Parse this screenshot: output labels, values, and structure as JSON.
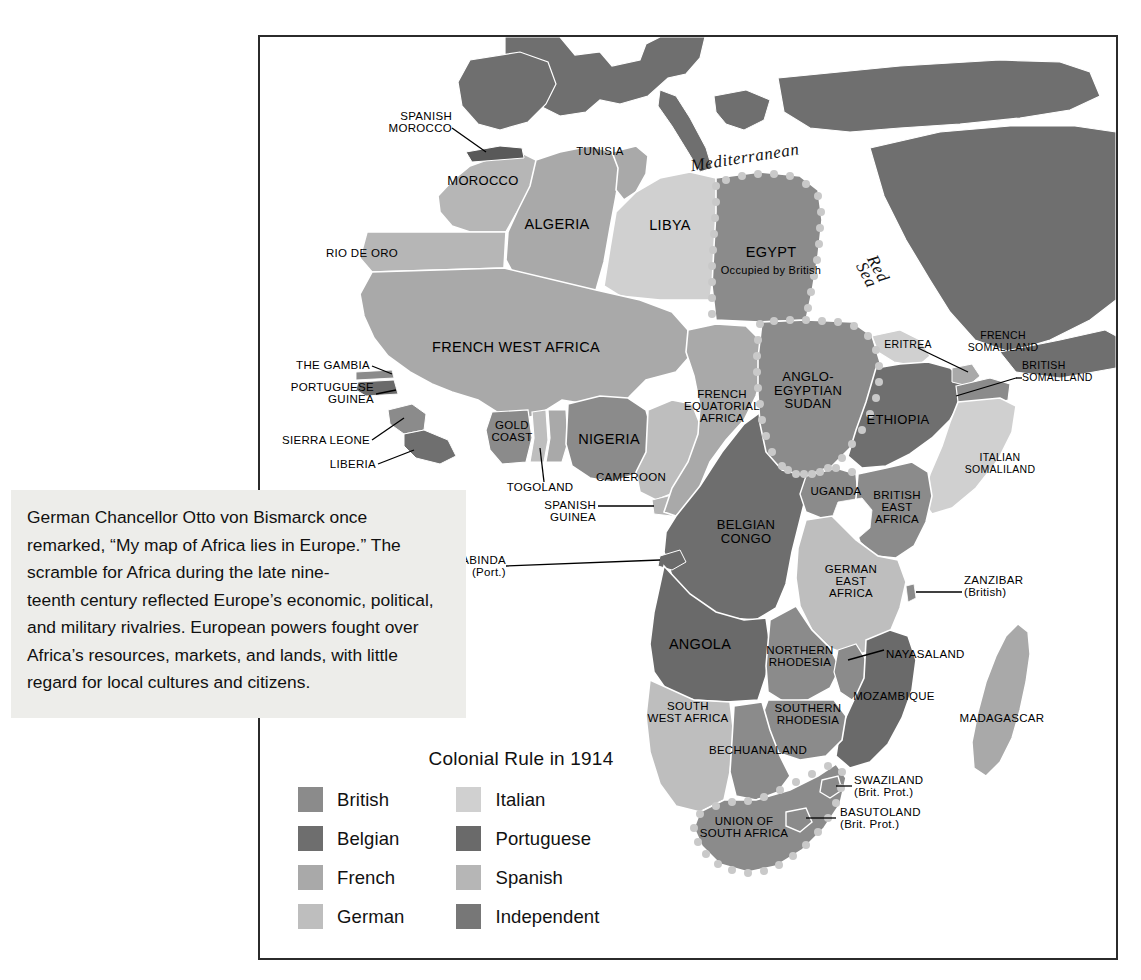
{
  "callout": {
    "text": "German Chancellor Otto von Bismarck once remarked, “My map of Africa lies in Europe.” The scramble for Africa during the late nine-\nteenth century reflected Europe’s economic, political, and military rivalries. European powers fought over Africa’s resources, markets, and lands, with little regard for local cultures and citizens."
  },
  "legend": {
    "title": "Colonial Rule in 1914",
    "left_column": [
      {
        "label": "British",
        "color": "#8b8b8b"
      },
      {
        "label": "Belgian",
        "color": "#6e6e6e"
      },
      {
        "label": "French",
        "color": "#a9a9a9"
      },
      {
        "label": "German",
        "color": "#bebebe"
      }
    ],
    "right_column": [
      {
        "label": "Italian",
        "color": "#d0d0d0"
      },
      {
        "label": "Portuguese",
        "color": "#6a6a6a"
      },
      {
        "label": "Spanish",
        "color": "#b6b6b6"
      },
      {
        "label": "Independent",
        "color": "#777777"
      }
    ]
  },
  "water_labels": [
    {
      "name": "Mediterranean",
      "text": "Mediterranean"
    },
    {
      "name": "Red Sea",
      "text": "Red\nSea"
    }
  ],
  "map_labels": [
    {
      "name": "spanish-morocco",
      "text": "SPANISH\nMOROCCO"
    },
    {
      "name": "morocco",
      "text": "MOROCCO"
    },
    {
      "name": "rio-de-oro",
      "text": "RIO DE ORO"
    },
    {
      "name": "algeria",
      "text": "ALGERIA"
    },
    {
      "name": "tunisia",
      "text": "TUNISIA"
    },
    {
      "name": "libya",
      "text": "LIBYA"
    },
    {
      "name": "egypt",
      "text": "EGYPT"
    },
    {
      "name": "egypt-note",
      "text": "Occupied by British"
    },
    {
      "name": "french-west-africa",
      "text": "FRENCH WEST AFRICA"
    },
    {
      "name": "the-gambia",
      "text": "THE GAMBIA"
    },
    {
      "name": "portuguese-guinea",
      "text": "PORTUGUESE\nGUINEA"
    },
    {
      "name": "sierra-leone",
      "text": "SIERRA LEONE"
    },
    {
      "name": "liberia",
      "text": "LIBERIA"
    },
    {
      "name": "gold-coast",
      "text": "GOLD\nCOAST"
    },
    {
      "name": "togoland",
      "text": "TOGOLAND"
    },
    {
      "name": "nigeria",
      "text": "NIGERIA"
    },
    {
      "name": "cameroon",
      "text": "CAMEROON"
    },
    {
      "name": "spanish-guinea",
      "text": "SPANISH\nGUINEA"
    },
    {
      "name": "french-equatorial",
      "text": "FRENCH\nEQUATORIAL\nAFRICA"
    },
    {
      "name": "anglo-egyptian-sudan",
      "text": "ANGLO-\nEGYPTIAN\nSUDAN"
    },
    {
      "name": "eritrea",
      "text": "ERITREA"
    },
    {
      "name": "french-somaliland",
      "text": "FRENCH\nSOMALILAND"
    },
    {
      "name": "british-somaliland",
      "text": "BRITISH\nSOMALILAND"
    },
    {
      "name": "italian-somaliland",
      "text": "ITALIAN\nSOMALILAND"
    },
    {
      "name": "ethiopia",
      "text": "ETHIOPIA"
    },
    {
      "name": "uganda",
      "text": "UGANDA"
    },
    {
      "name": "british-east-africa",
      "text": "BRITISH\nEAST\nAFRICA"
    },
    {
      "name": "german-east-africa",
      "text": "GERMAN\nEAST\nAFRICA"
    },
    {
      "name": "zanzibar",
      "text": "ZANZIBAR\n(British)"
    },
    {
      "name": "belgian-congo",
      "text": "BELGIAN\nCONGO"
    },
    {
      "name": "cabinda",
      "text": "CABINDA\n(Port.)"
    },
    {
      "name": "angola",
      "text": "ANGOLA"
    },
    {
      "name": "northern-rhodesia",
      "text": "NORTHERN\nRHODESIA"
    },
    {
      "name": "nayasaland",
      "text": "NAYASALAND"
    },
    {
      "name": "mozambique",
      "text": "MOZAMBIQUE"
    },
    {
      "name": "southern-rhodesia",
      "text": "SOUTHERN\nRHODESIA"
    },
    {
      "name": "south-west-africa",
      "text": "SOUTH\nWEST AFRICA"
    },
    {
      "name": "bechuanaland",
      "text": "BECHUANALAND"
    },
    {
      "name": "swaziland",
      "text": "SWAZILAND\n(Brit. Prot.)"
    },
    {
      "name": "basutoland",
      "text": "BASUTOLAND\n(Brit. Prot.)"
    },
    {
      "name": "union-of-south-africa",
      "text": "UNION OF\nSOUTH AFRICA"
    },
    {
      "name": "madagascar",
      "text": "MADAGASCAR"
    }
  ]
}
